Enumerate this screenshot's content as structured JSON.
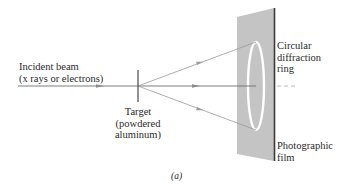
{
  "labels": {
    "incident_beam_line1": "Incident beam",
    "incident_beam_line2": "(x rays or electrons)",
    "target_line1": "Target",
    "target_line2": "(powdered",
    "target_line3": "aluminum)",
    "ring_line1": "Circular",
    "ring_line2": "diffraction",
    "ring_line3": "ring",
    "film_line1": "Photographic",
    "film_line2": "film",
    "caption": "(a)"
  },
  "colors": {
    "film_fill": "#c4c4c4",
    "film_edge": "#3a3a3a",
    "beam": "#6e6e6e",
    "ray": "#9a9a9a",
    "ring": "#ffffff",
    "text": "#2a2a2a"
  }
}
